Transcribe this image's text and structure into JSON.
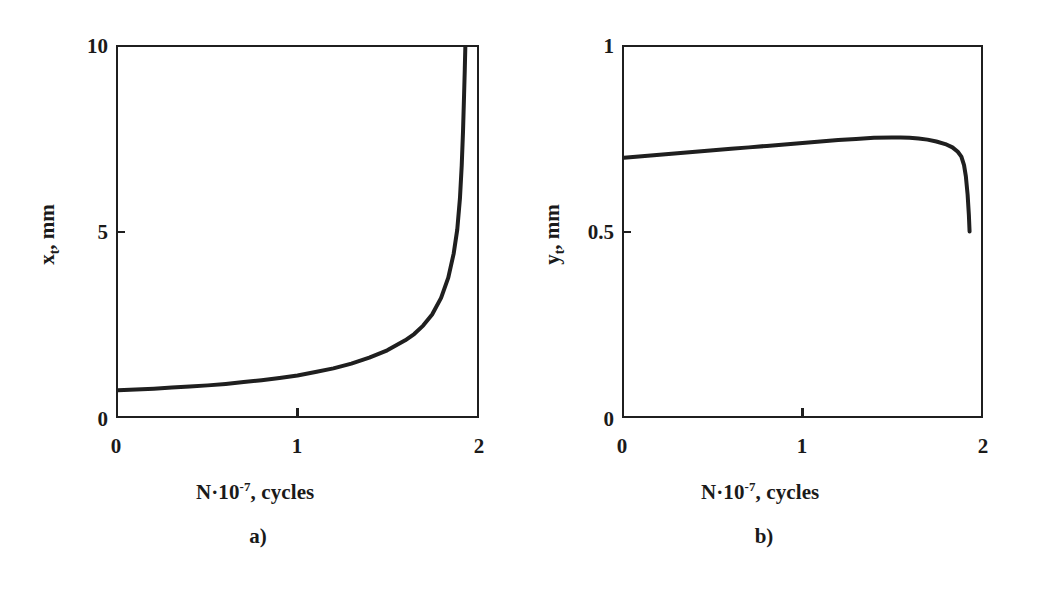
{
  "figure": {
    "background_color": "#ffffff",
    "ink_color": "#1f1f1f",
    "panels": [
      {
        "caption": "a)",
        "xlabel_prefix": "N·10",
        "xlabel_exponent": "-7",
        "xlabel_suffix": ", cycles",
        "ylabel_var": "x",
        "ylabel_sub": "t",
        "ylabel_suffix": ", mm",
        "x_ticks": [
          "0",
          "1",
          "2"
        ],
        "y_ticks": [
          "0",
          "5",
          "10"
        ]
      },
      {
        "caption": "b)",
        "xlabel_prefix": "N·10",
        "xlabel_exponent": "-7",
        "xlabel_suffix": ", cycles",
        "ylabel_var": "y",
        "ylabel_sub": "t",
        "ylabel_suffix": ", mm",
        "x_ticks": [
          "0",
          "1",
          "2"
        ],
        "y_ticks": [
          "0",
          "0.5",
          "1"
        ]
      }
    ]
  },
  "chart_data": [
    {
      "type": "line",
      "title": "",
      "subtitle": "a)",
      "xlabel": "N·10-7, cycles",
      "ylabel": "xt, mm",
      "xlim": [
        0,
        2
      ],
      "ylim": [
        0,
        10
      ],
      "xticks": [
        0,
        1,
        2
      ],
      "yticks": [
        0,
        5,
        10
      ],
      "grid": false,
      "legend": "none",
      "series": [
        {
          "name": "crack tip displacement xt",
          "x": [
            0.0,
            0.1,
            0.2,
            0.3,
            0.4,
            0.5,
            0.6,
            0.7,
            0.8,
            0.9,
            1.0,
            1.1,
            1.2,
            1.3,
            1.4,
            1.5,
            1.6,
            1.65,
            1.7,
            1.75,
            1.8,
            1.84,
            1.87,
            1.89,
            1.905,
            1.915,
            1.922,
            1.928,
            1.932,
            1.935
          ],
          "y": [
            0.7,
            0.72,
            0.74,
            0.77,
            0.8,
            0.83,
            0.87,
            0.92,
            0.97,
            1.03,
            1.1,
            1.19,
            1.29,
            1.42,
            1.58,
            1.78,
            2.05,
            2.22,
            2.45,
            2.75,
            3.2,
            3.75,
            4.4,
            5.05,
            5.9,
            6.8,
            7.7,
            8.7,
            9.4,
            10.0
          ]
        }
      ]
    },
    {
      "type": "line",
      "title": "",
      "subtitle": "b)",
      "xlabel": "N·10-7, cycles",
      "ylabel": "yt, mm",
      "xlim": [
        0,
        2
      ],
      "ylim": [
        0,
        1
      ],
      "xticks": [
        0,
        1,
        2
      ],
      "yticks": [
        0,
        0.5,
        1
      ],
      "grid": false,
      "legend": "none",
      "series": [
        {
          "name": "crack tip displacement yt",
          "x": [
            0.0,
            0.1,
            0.2,
            0.3,
            0.4,
            0.5,
            0.6,
            0.7,
            0.8,
            0.9,
            1.0,
            1.1,
            1.2,
            1.3,
            1.4,
            1.5,
            1.55,
            1.6,
            1.65,
            1.7,
            1.75,
            1.8,
            1.84,
            1.87,
            1.89,
            1.905,
            1.915,
            1.925,
            1.932,
            1.936
          ],
          "y": [
            0.7,
            0.704,
            0.708,
            0.712,
            0.716,
            0.72,
            0.724,
            0.728,
            0.732,
            0.736,
            0.74,
            0.744,
            0.748,
            0.751,
            0.754,
            0.755,
            0.755,
            0.754,
            0.752,
            0.749,
            0.744,
            0.737,
            0.728,
            0.716,
            0.703,
            0.68,
            0.65,
            0.6,
            0.545,
            0.5
          ]
        }
      ]
    }
  ]
}
